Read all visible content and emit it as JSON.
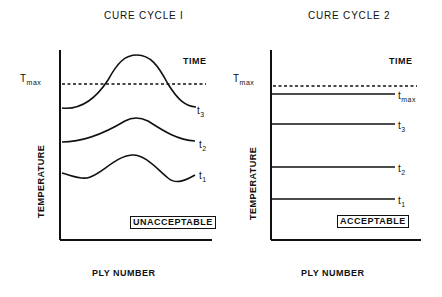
{
  "panels": [
    {
      "title": "CURE CYCLE I",
      "time_label": "TIME",
      "tmax_label": "T",
      "tmax_sub": "max",
      "y_axis_label": "TEMPERATURE",
      "x_axis_label": "PLY NUMBER",
      "verdict": "UNACCEPTABLE",
      "curves": [
        {
          "label": "t",
          "sub": "3"
        },
        {
          "label": "t",
          "sub": "2"
        },
        {
          "label": "t",
          "sub": "1"
        }
      ]
    },
    {
      "title": "CURE CYCLE 2",
      "time_label": "TIME",
      "tmax_label": "T",
      "tmax_sub": "max",
      "y_axis_label": "TEMPERATURE",
      "x_axis_label": "PLY NUMBER",
      "verdict": "ACCEPTABLE",
      "curves": [
        {
          "label": "t",
          "sub": "max"
        },
        {
          "label": "t",
          "sub": "3"
        },
        {
          "label": "t",
          "sub": "2"
        },
        {
          "label": "t",
          "sub": "1"
        }
      ]
    }
  ],
  "colors": {
    "ink": "#111111",
    "background": "#ffffff"
  }
}
